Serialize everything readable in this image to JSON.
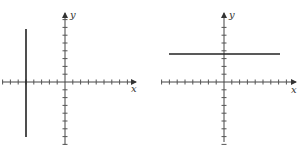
{
  "figures": [
    {
      "id": "left",
      "description": "Vertical line x = -5 on a coordinate grid",
      "axis_labels": {
        "x": "x",
        "y": "y"
      },
      "origin_px": [
        65,
        82
      ],
      "tick_spacing_px": 7.8,
      "x_ticks": [
        -8,
        -7,
        -6,
        -5,
        -4,
        -3,
        -2,
        -1,
        1,
        2,
        3,
        4,
        5,
        6,
        7,
        8
      ],
      "y_ticks": [
        -8,
        -7,
        -6,
        -5,
        -4,
        -3,
        -2,
        -1,
        1,
        2,
        3,
        4,
        5,
        6,
        7,
        8
      ],
      "line": {
        "type": "vertical",
        "x": -5
      }
    },
    {
      "id": "right",
      "description": "Horizontal line y = 3.5 on a coordinate grid",
      "axis_labels": {
        "x": "x",
        "y": "y"
      },
      "origin_px": [
        224,
        82
      ],
      "tick_spacing_px": 7.8,
      "x_ticks": [
        -8,
        -7,
        -6,
        -5,
        -4,
        -3,
        -2,
        -1,
        1,
        2,
        3,
        4,
        5,
        6,
        7,
        8
      ],
      "y_ticks": [
        -8,
        -7,
        -6,
        -5,
        -4,
        -3,
        -2,
        -1,
        1,
        2,
        3,
        4,
        5,
        6,
        7
      ],
      "line": {
        "type": "horizontal",
        "y": 3.5
      }
    }
  ],
  "colors": {
    "axis": "#444444",
    "line": "#222222",
    "background": "#ffffff"
  }
}
